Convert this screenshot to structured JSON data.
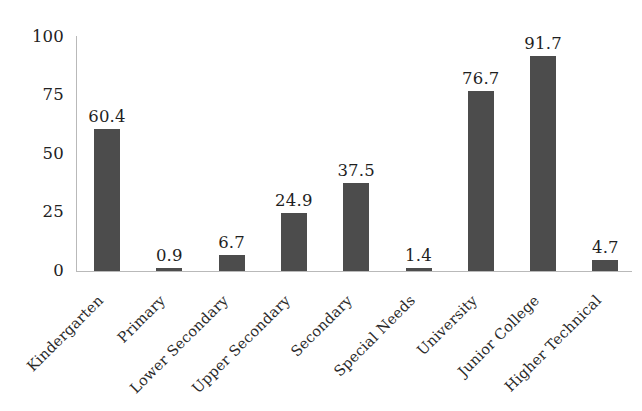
{
  "chart_data": {
    "type": "bar",
    "title": "",
    "subtitle": "",
    "xlabel": "",
    "ylabel": "",
    "ylim": [
      0,
      100
    ],
    "yticks": [
      0,
      25,
      50,
      75,
      100
    ],
    "grid": false,
    "legend": null,
    "bar_color": "#4c4c4c",
    "axis_color": "#b9b9b9",
    "label_rotation": -45,
    "categories": [
      "Kindergarten",
      "Primary",
      "Lower Secondary",
      "Upper Secondary",
      "Secondary",
      "Special Needs",
      "University",
      "Junior College",
      "Higher Technical"
    ],
    "values": [
      60.4,
      0.9,
      6.7,
      24.9,
      37.5,
      1.4,
      76.7,
      91.7,
      4.7
    ],
    "value_labels": [
      "60.4",
      "0.9",
      "6.7",
      "24.9",
      "37.5",
      "1.4",
      "76.7",
      "91.7",
      "4.7"
    ],
    "ytick_labels": [
      "0",
      "25",
      "50",
      "75",
      "100"
    ]
  }
}
